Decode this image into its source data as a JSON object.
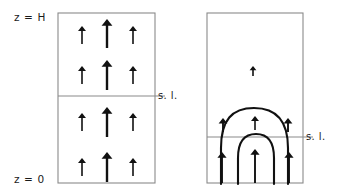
{
  "figure": {
    "title": "",
    "background_color": "#ffffff",
    "width": 340,
    "height": 193
  },
  "labels": {
    "z_top": "z = H",
    "z_bottom": "z = 0",
    "sea_level_left": "s. l.",
    "sea_level_right": "s. l."
  },
  "colors": {
    "ink": "#111111",
    "box_stroke": "#8a8a8a",
    "background": "#ffffff"
  },
  "panels": [
    {
      "name": "uniform-flux-panel",
      "x": 58,
      "y": 13,
      "width": 97,
      "height": 170,
      "sea_level_y": 96,
      "description": "uniform upward arrows",
      "arrows": [
        {
          "x": 82,
          "y_tail": 44,
          "y_head": 26,
          "width": 1.6,
          "head": 4.0
        },
        {
          "x": 107,
          "y_tail": 48,
          "y_head": 19,
          "width": 2.4,
          "head": 5.4
        },
        {
          "x": 133,
          "y_tail": 44,
          "y_head": 26,
          "width": 1.6,
          "head": 4.0
        },
        {
          "x": 82,
          "y_tail": 84,
          "y_head": 66,
          "width": 1.6,
          "head": 4.0
        },
        {
          "x": 107,
          "y_tail": 90,
          "y_head": 60,
          "width": 2.4,
          "head": 5.4
        },
        {
          "x": 133,
          "y_tail": 84,
          "y_head": 66,
          "width": 1.6,
          "head": 4.0
        },
        {
          "x": 82,
          "y_tail": 131,
          "y_head": 113,
          "width": 1.6,
          "head": 4.0
        },
        {
          "x": 107,
          "y_tail": 137,
          "y_head": 107,
          "width": 2.4,
          "head": 5.4
        },
        {
          "x": 133,
          "y_tail": 131,
          "y_head": 113,
          "width": 1.6,
          "head": 4.0
        },
        {
          "x": 82,
          "y_tail": 176,
          "y_head": 158,
          "width": 1.6,
          "head": 4.0
        },
        {
          "x": 107,
          "y_tail": 182,
          "y_head": 152,
          "width": 2.4,
          "head": 5.4
        },
        {
          "x": 133,
          "y_tail": 176,
          "y_head": 158,
          "width": 1.6,
          "head": 4.0
        }
      ]
    },
    {
      "name": "recirculation-panel",
      "x": 207,
      "y": 13,
      "width": 96,
      "height": 170,
      "sea_level_y": 137,
      "description": "nested arch streamlines with upward arrows",
      "arrows": [
        {
          "x": 253,
          "y_tail": 76,
          "y_head": 66,
          "width": 1.6,
          "head": 3.4
        },
        {
          "x": 255,
          "y_tail": 130,
          "y_head": 116,
          "width": 1.6,
          "head": 4.0
        },
        {
          "x": 223,
          "y_tail": 132,
          "y_head": 118,
          "width": 1.9,
          "head": 4.4
        },
        {
          "x": 288,
          "y_tail": 132,
          "y_head": 118,
          "width": 1.9,
          "head": 4.4
        },
        {
          "x": 255,
          "y_tail": 183,
          "y_head": 149,
          "width": 1.9,
          "head": 4.6
        },
        {
          "x": 222,
          "y_tail": 183,
          "y_head": 152,
          "width": 1.9,
          "head": 4.6
        },
        {
          "x": 289,
          "y_tail": 183,
          "y_head": 152,
          "width": 1.9,
          "head": 4.6
        }
      ],
      "streamlines": [
        {
          "name": "outer-arch",
          "path": "M 221 184 L 221 148 C 221 120 232 108 254 108 C 276 108 288 120 288 148 L 288 184"
        },
        {
          "name": "inner-arch",
          "path": "M 238 184 L 238 158 C 238 141 245 134 256 134 C 267 134 274 141 274 158 L 274 184"
        }
      ]
    }
  ],
  "sea_level_lines": [
    {
      "name": "sea-level-left",
      "x1": 58,
      "x2": 165,
      "y": 96,
      "label_x": 158,
      "label_y": 99
    },
    {
      "name": "sea-level-right",
      "x1": 207,
      "x2": 313,
      "y": 137,
      "label_x": 306,
      "label_y": 140
    }
  ],
  "chart_data": {
    "type": "diagram",
    "title": "",
    "xlabel": "",
    "ylabel": "z",
    "axis_annotations": [
      "z = H",
      "z = 0"
    ],
    "reference_lines": [
      "s. l.",
      "s. l."
    ],
    "panel_count": 2,
    "legend": []
  }
}
